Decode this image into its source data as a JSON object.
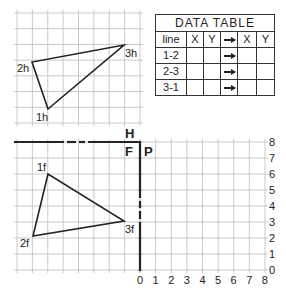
{
  "diagram": {
    "grid": {
      "spacing_px": 15.6,
      "color": "#b8b8b8"
    },
    "fold_lines": {
      "horizontal_labels": {
        "above": "H",
        "below": "F"
      },
      "vertical_labels": {
        "left": "F",
        "right": "P"
      }
    },
    "horizontal_view": {
      "points": [
        {
          "label": "1h",
          "x": 48,
          "y": 109
        },
        {
          "label": "2h",
          "x": 32,
          "y": 62
        },
        {
          "label": "3h",
          "x": 124,
          "y": 45
        }
      ]
    },
    "frontal_view": {
      "points": [
        {
          "label": "1f",
          "x": 48,
          "y": 174
        },
        {
          "label": "2f",
          "x": 33,
          "y": 236
        },
        {
          "label": "3f",
          "x": 124,
          "y": 221
        }
      ]
    },
    "profile_axes": {
      "x_ticks": [
        "0",
        "1",
        "2",
        "3",
        "4",
        "5",
        "6",
        "7",
        "8"
      ],
      "y_ticks": [
        "0",
        "1",
        "2",
        "3",
        "4",
        "5",
        "6",
        "7",
        "8"
      ]
    }
  },
  "data_table": {
    "title": "DATA TABLE",
    "headers": [
      "line",
      "X",
      "Y",
      "→",
      "X",
      "Y"
    ],
    "rows": [
      {
        "line": "1-2",
        "x1": "",
        "y1": "",
        "x2": "",
        "y2": ""
      },
      {
        "line": "2-3",
        "x1": "",
        "y1": "",
        "x2": "",
        "y2": ""
      },
      {
        "line": "3-1",
        "x1": "",
        "y1": "",
        "x2": "",
        "y2": ""
      }
    ]
  }
}
